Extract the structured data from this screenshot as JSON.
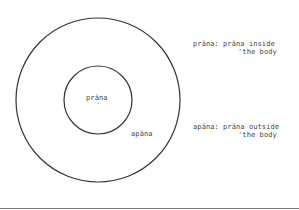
{
  "diagram": {
    "inner_circle_label": "prāna",
    "outer_ring_label": "apāna",
    "legend": [
      {
        "term": "prāna:",
        "definition_line1": "prāna inside",
        "definition_line2": "'the body"
      },
      {
        "term": "apāna:",
        "definition_line1": "prāna outside",
        "definition_line2": "'the body"
      }
    ]
  }
}
